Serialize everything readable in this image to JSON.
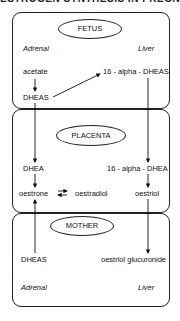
{
  "title_fragment": "ESTROGEN SYNTHESIS IN PREGNANCY",
  "compartments": [
    {
      "name": "FETUS",
      "left_organ": "Adrenal",
      "right_organ": "Liver"
    },
    {
      "name": "PLACENTA"
    },
    {
      "name": "MOTHER",
      "left_organ": "Adrenal",
      "right_organ": "Liver"
    }
  ],
  "nodes": {
    "fetus_acetate": "acetate",
    "fetus_dheas": "DHEAS",
    "fetus_16_alpha_dheas": "16 - alpha - DHEAS",
    "placenta_dhea": "DHEA",
    "placenta_16_alpha_dhea": "16 - alpha - DHEA",
    "placenta_oestrone": "oestrone",
    "placenta_oestradiol": "oestradiol",
    "placenta_oestriol": "oestriol",
    "mother_dheas": "DHEAS",
    "mother_oestriol_glucuronide": "oestriol glucuronide"
  },
  "edges": [
    {
      "from": "acetate",
      "to": "DHEAS (fetus)"
    },
    {
      "from": "DHEAS (fetus)",
      "to": "16 - alpha - DHEAS"
    },
    {
      "from": "DHEAS (fetus)",
      "to": "DHEA"
    },
    {
      "from": "16 - alpha - DHEAS",
      "to": "16 - alpha - DHEA"
    },
    {
      "from": "DHEA",
      "to": "oestrone"
    },
    {
      "from": "oestrone",
      "to": "oestradiol",
      "bidirectional": true
    },
    {
      "from": "16 - alpha - DHEA",
      "to": "oestriol"
    },
    {
      "from": "DHEAS (mother)",
      "to": "oestrone"
    },
    {
      "from": "oestriol",
      "to": "oestriol glucuronide"
    }
  ]
}
